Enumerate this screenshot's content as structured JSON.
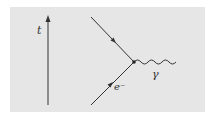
{
  "diagram": {
    "type": "feynman",
    "title": "",
    "background": "#e6e6e6",
    "line_color": "#333333",
    "time_axis": {
      "label": "t",
      "direction": "up"
    },
    "particles": [
      {
        "id": "incoming-electron",
        "kind": "fermion",
        "label": "e⁻",
        "arrow": "toward-vertex"
      },
      {
        "id": "outgoing-electron",
        "kind": "fermion",
        "label": "",
        "arrow": "away-from-vertex"
      },
      {
        "id": "photon",
        "kind": "boson-wavy",
        "label": "γ"
      }
    ],
    "vertex": {
      "label": ""
    }
  }
}
